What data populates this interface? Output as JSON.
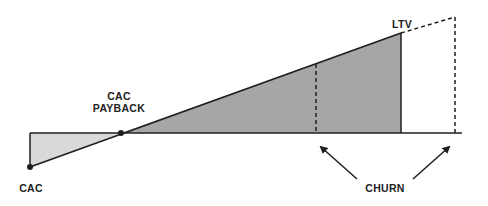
{
  "diagram": {
    "labels": {
      "cac": "CAC",
      "cac_payback_line1": "CAC",
      "cac_payback_line2": "PAYBACK",
      "ltv": "LTV",
      "churn": "CHURN"
    },
    "colors": {
      "cost_fill": "#d9d9d9",
      "value_fill": "#a6a6a6",
      "line": "#1f1f1f"
    }
  }
}
